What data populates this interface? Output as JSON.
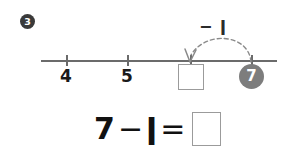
{
  "problem": {
    "number": "3",
    "badge_style": "filled-circle-white-text"
  },
  "number_line": {
    "ticks": [
      {
        "label": "4",
        "x": 66
      },
      {
        "label": "5",
        "x": 127
      },
      {
        "label": "",
        "x": 190
      },
      {
        "label": "",
        "x": 251
      }
    ],
    "blank_box_label": "",
    "start_marker": {
      "value": "7",
      "color": "#7d7d7d",
      "text_color": "#ffffff"
    },
    "axis_color": "#6b6b6b"
  },
  "jump": {
    "label": "− ǀ",
    "operation": "subtract",
    "amount": "1",
    "direction": "leftward",
    "style": "dashed-arc-with-arrowhead",
    "arc_color": "#8a8a8a"
  },
  "equation": {
    "left_operand": "7",
    "operator": "−",
    "right_operand": "ǀ",
    "equals": "=",
    "answer": "",
    "answer_box_border": "#9b9b9b"
  }
}
